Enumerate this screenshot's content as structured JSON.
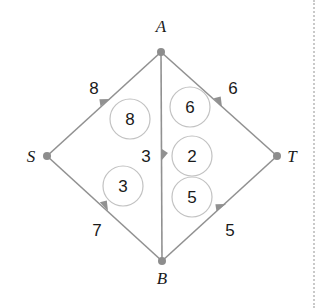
{
  "figure": {
    "type": "flow-network-diagram",
    "background_color": "#ffffff",
    "edge_color": "#919191",
    "node_color": "#8d8d8d",
    "circle_stroke_color": "#c2c2c2",
    "text_color": "#1a1a1a"
  },
  "nodes": [
    {
      "id": "A",
      "label": "A",
      "x": 161,
      "y": 52,
      "label_x": 161,
      "label_y": 32
    },
    {
      "id": "S",
      "label": "S",
      "x": 47,
      "y": 156,
      "label_x": 31,
      "label_y": 162
    },
    {
      "id": "T",
      "label": "T",
      "x": 277,
      "y": 156,
      "label_x": 292,
      "label_y": 162
    },
    {
      "id": "B",
      "label": "B",
      "x": 162,
      "y": 261,
      "label_x": 162,
      "label_y": 284
    }
  ],
  "edges": [
    {
      "id": "S-A",
      "from": "S",
      "to": "A",
      "capacity": "8",
      "label_x": 94,
      "label_y": 94,
      "arrow_x": 104,
      "arrow_y": 104
    },
    {
      "id": "A-T",
      "from": "A",
      "to": "T",
      "capacity": "6",
      "label_x": 233,
      "label_y": 94,
      "arrow_x": 218,
      "arrow_y": 104
    },
    {
      "id": "A-B",
      "from": "A",
      "to": "B",
      "capacity": "3",
      "label_x": 146,
      "label_y": 162,
      "arrow_x": 161,
      "arrow_y": 157
    },
    {
      "id": "S-B",
      "from": "S",
      "to": "B",
      "capacity": "7",
      "label_x": 97,
      "label_y": 236,
      "arrow_x": 104,
      "arrow_y": 208
    },
    {
      "id": "B-T",
      "from": "B",
      "to": "T",
      "capacity": "5",
      "label_x": 230,
      "label_y": 236,
      "arrow_x": 221,
      "arrow_y": 208
    }
  ],
  "flow_circles": [
    {
      "id": "flow-S-A",
      "edge": "S-A",
      "value": "8",
      "cx": 130,
      "cy": 119,
      "r": 20
    },
    {
      "id": "flow-A-T",
      "edge": "A-T",
      "value": "6",
      "cx": 190,
      "cy": 107,
      "r": 20
    },
    {
      "id": "flow-A-B",
      "edge": "A-B",
      "value": "2",
      "cx": 192,
      "cy": 156,
      "r": 20
    },
    {
      "id": "flow-S-B",
      "edge": "S-B",
      "value": "3",
      "cx": 123,
      "cy": 186,
      "r": 20
    },
    {
      "id": "flow-B-T",
      "edge": "B-T",
      "value": "5",
      "cx": 192,
      "cy": 197,
      "r": 20
    }
  ],
  "page_rule": {
    "x": 313,
    "style": "dotted",
    "color": "#c9c9c9"
  }
}
